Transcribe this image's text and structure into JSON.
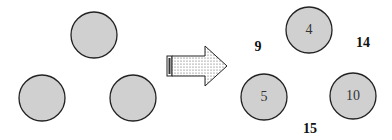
{
  "diagram": {
    "left_circles": [
      {
        "cx": 94,
        "cy": 35,
        "r": 23
      },
      {
        "cx": 42,
        "cy": 98,
        "r": 23
      },
      {
        "cx": 133,
        "cy": 98,
        "r": 23
      }
    ],
    "right_circles": [
      {
        "cx": 309,
        "cy": 30,
        "r": 23,
        "label": "4"
      },
      {
        "cx": 264,
        "cy": 97,
        "r": 23,
        "label": "5"
      },
      {
        "cx": 353,
        "cy": 96,
        "r": 23,
        "label": "10"
      }
    ],
    "sum_labels": [
      {
        "x": 258,
        "y": 47,
        "text": "9"
      },
      {
        "x": 363,
        "y": 43,
        "text": "14"
      },
      {
        "x": 310,
        "y": 129,
        "text": "15"
      }
    ],
    "arrow": {
      "direction": "right"
    },
    "colors": {
      "circle_fill": "#d0d0d0",
      "stroke": "#222222"
    }
  }
}
